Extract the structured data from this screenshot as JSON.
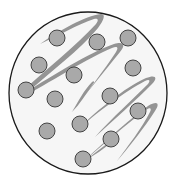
{
  "diagram": {
    "title": "",
    "colors": {
      "background": "#ffffff",
      "container_fill": "#f6f6f6",
      "container_stroke": "#1a1a1a",
      "particle_fill": "#a9a9a9",
      "particle_stroke": "#444444",
      "strand": "#8a8a8a"
    },
    "container": {
      "cx": 88,
      "cy": 93,
      "rx": 79,
      "ry": 81
    },
    "particle_radius": 8,
    "particles": [
      {
        "cx": 57,
        "cy": 38
      },
      {
        "cx": 97,
        "cy": 42
      },
      {
        "cx": 128,
        "cy": 38
      },
      {
        "cx": 39,
        "cy": 65
      },
      {
        "cx": 74,
        "cy": 75
      },
      {
        "cx": 133,
        "cy": 68
      },
      {
        "cx": 26,
        "cy": 90
      },
      {
        "cx": 55,
        "cy": 99
      },
      {
        "cx": 110,
        "cy": 96
      },
      {
        "cx": 138,
        "cy": 111
      },
      {
        "cx": 80,
        "cy": 124
      },
      {
        "cx": 47,
        "cy": 131
      },
      {
        "cx": 111,
        "cy": 139
      },
      {
        "cx": 83,
        "cy": 159
      }
    ]
  }
}
